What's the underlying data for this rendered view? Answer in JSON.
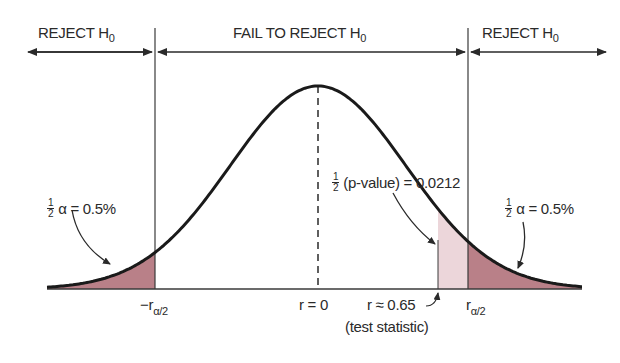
{
  "regions": {
    "left": {
      "label": "REJECT H",
      "sub": "0"
    },
    "middle": {
      "label": "FAIL TO REJECT H",
      "sub": "0"
    },
    "right": {
      "label": "REJECT H",
      "sub": "0"
    }
  },
  "annotations": {
    "left_tail": {
      "frac_num": "1",
      "frac_den": "2",
      "text": "α = 0.5%"
    },
    "right_tail": {
      "frac_num": "1",
      "frac_den": "2",
      "text": "α = 0.5%"
    },
    "p_value": {
      "frac_num": "1",
      "frac_den": "2",
      "text": "(p-value) = 0.0212"
    }
  },
  "axis_labels": {
    "neg_critical": {
      "prefix": "−r",
      "sub": "α/2"
    },
    "center": "r = 0",
    "test_stat": "r ≈ 0.65",
    "test_stat_note": "(test statistic)",
    "pos_critical": {
      "prefix": "r",
      "sub": "α/2"
    }
  },
  "colors": {
    "curve": "#1a1a1a",
    "rejection_fill": "#b98088",
    "pvalue_fill": "#ecd6da",
    "line": "#3a3a3a"
  },
  "chart_data": {
    "type": "area",
    "title": "",
    "x_markers": [
      {
        "name": "-r_alpha/2",
        "position": "left critical value"
      },
      {
        "name": "r = 0",
        "value": 0
      },
      {
        "name": "r ≈ 0.65",
        "value": 0.65,
        "note": "test statistic"
      },
      {
        "name": "r_alpha/2",
        "position": "right critical value"
      }
    ],
    "shaded_areas": [
      {
        "region": "left tail",
        "area": "0.5%",
        "meaning": "1/2 alpha"
      },
      {
        "region": "right tail",
        "area": "0.5%",
        "meaning": "1/2 alpha"
      },
      {
        "region": "beyond test statistic",
        "area": 0.0212,
        "meaning": "1/2 p-value"
      }
    ],
    "regions": [
      "REJECT H0",
      "FAIL TO REJECT H0",
      "REJECT H0"
    ]
  }
}
